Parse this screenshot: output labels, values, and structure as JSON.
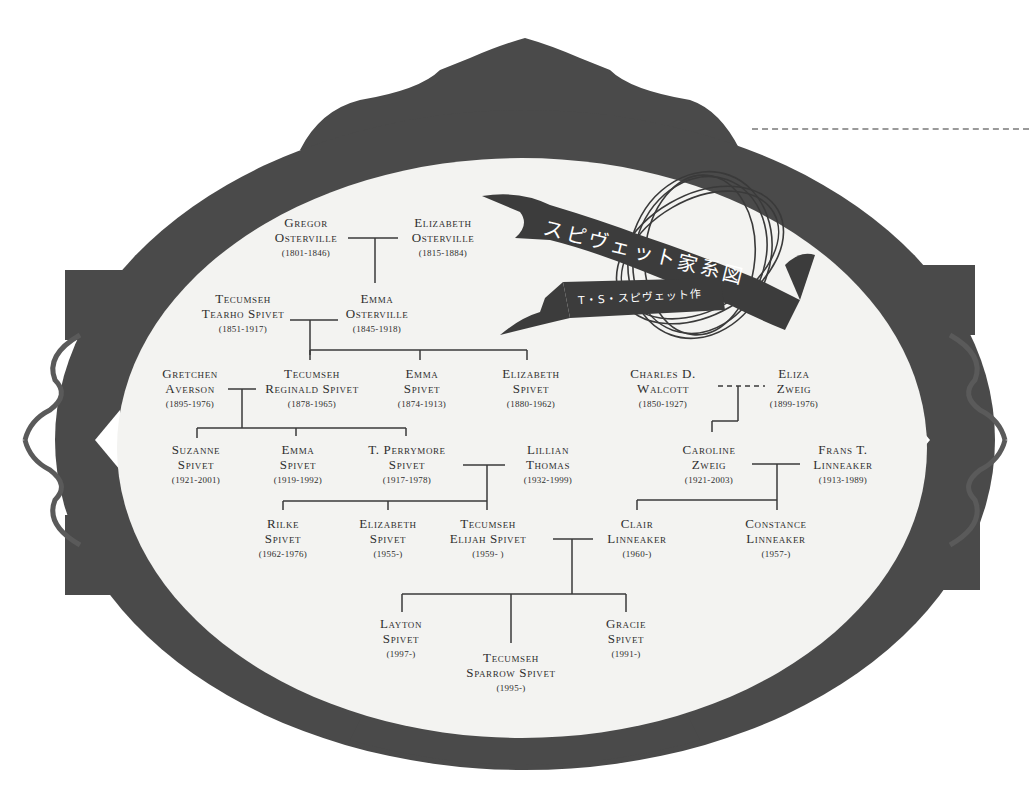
{
  "title": {
    "main": "スピヴェット家系図",
    "subtitle": "T・S・スピヴェット作"
  },
  "colors": {
    "frame": "#4a4a4a",
    "oval": "#f3f3f1",
    "line": "#3a3a3a",
    "text": "#2e2e2e",
    "background": "#ffffff"
  },
  "people": {
    "gregor_osterville": {
      "name1": "Gregor",
      "name2": "Osterville",
      "dates": "(1801-1846)"
    },
    "elizabeth_osterville": {
      "name1": "Elizabeth",
      "name2": "Osterville",
      "dates": "(1815-1884)"
    },
    "tecumseh_tearho_spivet": {
      "name1": "Tecumseh",
      "name2": "Tearho Spivet",
      "dates": "(1851-1917)"
    },
    "emma_osterville": {
      "name1": "Emma",
      "name2": "Osterville",
      "dates": "(1845-1918)"
    },
    "gretchen_averson": {
      "name1": "Gretchen",
      "name2": "Averson",
      "dates": "(1895-1976)"
    },
    "tecumseh_reginald_spivet": {
      "name1": "Tecumseh",
      "name2": "Reginald Spivet",
      "dates": "(1878-1965)"
    },
    "emma_spivet_1874": {
      "name1": "Emma",
      "name2": "Spivet",
      "dates": "(1874-1913)"
    },
    "elizabeth_spivet_1880": {
      "name1": "Elizabeth",
      "name2": "Spivet",
      "dates": "(1880-1962)"
    },
    "charles_walcott": {
      "name1": "Charles D.",
      "name2": "Walcott",
      "dates": "(1850-1927)"
    },
    "eliza_zweig": {
      "name1": "Eliza",
      "name2": "Zweig",
      "dates": "(1899-1976)"
    },
    "suzanne_spivet": {
      "name1": "Suzanne",
      "name2": "Spivet",
      "dates": "(1921-2001)"
    },
    "emma_spivet_1919": {
      "name1": "Emma",
      "name2": "Spivet",
      "dates": "(1919-1992)"
    },
    "t_perrymore_spivet": {
      "name1": "T. Perrymore",
      "name2": "Spivet",
      "dates": "(1917-1978)"
    },
    "lillian_thomas": {
      "name1": "Lillian",
      "name2": "Thomas",
      "dates": "(1932-1999)"
    },
    "caroline_zweig": {
      "name1": "Caroline",
      "name2": "Zweig",
      "dates": "(1921-2003)"
    },
    "frans_linneaker": {
      "name1": "Frans T.",
      "name2": "Linneaker",
      "dates": "(1913-1989)"
    },
    "rilke_spivet": {
      "name1": "Rilke",
      "name2": "Spivet",
      "dates": "(1962-1976)"
    },
    "elizabeth_spivet_1955": {
      "name1": "Elizabeth",
      "name2": "Spivet",
      "dates": "(1955-)"
    },
    "tecumseh_elijah_spivet": {
      "name1": "Tecumseh",
      "name2": "Elijah Spivet",
      "dates": "(1959- )"
    },
    "clair_linneaker": {
      "name1": "Clair",
      "name2": "Linneaker",
      "dates": "(1960-)"
    },
    "constance_linneaker": {
      "name1": "Constance",
      "name2": "Linneaker",
      "dates": "(1957-)"
    },
    "layton_spivet": {
      "name1": "Layton",
      "name2": "Spivet",
      "dates": "(1997-)"
    },
    "tecumseh_sparrow_spivet": {
      "name1": "Tecumseh",
      "name2": "Sparrow Spivet",
      "dates": "(1995-)"
    },
    "gracie_spivet": {
      "name1": "Gracie",
      "name2": "Spivet",
      "dates": "(1991-)"
    }
  }
}
